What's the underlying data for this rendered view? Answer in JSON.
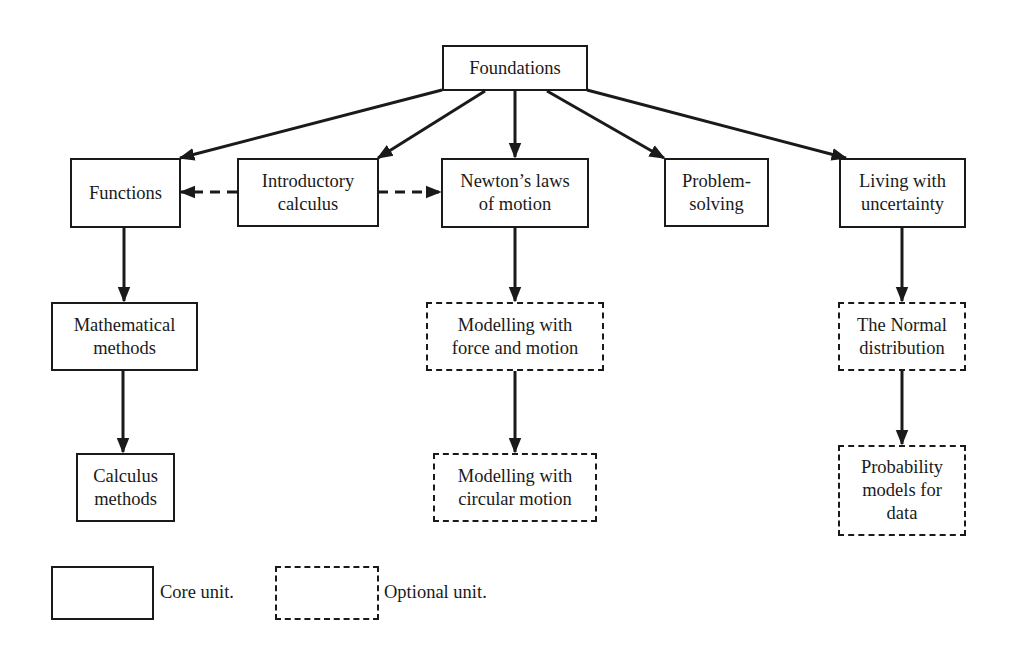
{
  "diagram": {
    "nodes": [
      {
        "id": "foundations",
        "label": "Foundations",
        "type": "core"
      },
      {
        "id": "functions",
        "label": "Functions",
        "type": "core"
      },
      {
        "id": "introductory-calculus",
        "label": "Introductory\ncalculus",
        "type": "core"
      },
      {
        "id": "newtons-laws",
        "label": "Newton’s laws\nof motion",
        "type": "core"
      },
      {
        "id": "problem-solving",
        "label": "Problem-\nsolving",
        "type": "core"
      },
      {
        "id": "living-with-uncertainty",
        "label": "Living with\nuncertainty",
        "type": "core"
      },
      {
        "id": "mathematical-methods",
        "label": "Mathematical\nmethods",
        "type": "core"
      },
      {
        "id": "calculus-methods",
        "label": "Calculus\nmethods",
        "type": "core"
      },
      {
        "id": "modelling-force-motion",
        "label": "Modelling with\nforce and motion",
        "type": "optional"
      },
      {
        "id": "modelling-circular-motion",
        "label": "Modelling with\ncircular motion",
        "type": "optional"
      },
      {
        "id": "normal-distribution",
        "label": "The Normal\ndistribution",
        "type": "optional"
      },
      {
        "id": "probability-models",
        "label": "Probability\nmodels for\ndata",
        "type": "optional"
      }
    ],
    "edges": [
      {
        "from": "foundations",
        "to": "functions",
        "style": "solid"
      },
      {
        "from": "foundations",
        "to": "introductory-calculus",
        "style": "solid"
      },
      {
        "from": "foundations",
        "to": "newtons-laws",
        "style": "solid"
      },
      {
        "from": "foundations",
        "to": "problem-solving",
        "style": "solid"
      },
      {
        "from": "foundations",
        "to": "living-with-uncertainty",
        "style": "solid"
      },
      {
        "from": "introductory-calculus",
        "to": "functions",
        "style": "dashed"
      },
      {
        "from": "introductory-calculus",
        "to": "newtons-laws",
        "style": "dashed"
      },
      {
        "from": "functions",
        "to": "mathematical-methods",
        "style": "solid"
      },
      {
        "from": "mathematical-methods",
        "to": "calculus-methods",
        "style": "solid"
      },
      {
        "from": "newtons-laws",
        "to": "modelling-force-motion",
        "style": "solid"
      },
      {
        "from": "modelling-force-motion",
        "to": "modelling-circular-motion",
        "style": "solid"
      },
      {
        "from": "living-with-uncertainty",
        "to": "normal-distribution",
        "style": "solid"
      },
      {
        "from": "normal-distribution",
        "to": "probability-models",
        "style": "solid"
      }
    ]
  },
  "legend": {
    "core_label": "Core unit.",
    "optional_label": "Optional unit."
  },
  "colors": {
    "ink": "#1a1a1a",
    "background": "#ffffff"
  }
}
